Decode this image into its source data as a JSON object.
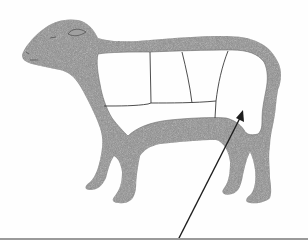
{
  "figure": {
    "colors": {
      "background": "#fefefe",
      "fleece": "#8f8f8f",
      "fleece_dark": "#7a7a7a",
      "cut_lines": "#3a3a3a",
      "arrow": "#1e1e1e",
      "bottom_rule": "#9a9a9a"
    },
    "cuts": [
      {
        "name": "shoulder"
      },
      {
        "name": "rack"
      },
      {
        "name": "loin"
      },
      {
        "name": "leg"
      },
      {
        "name": "breast"
      },
      {
        "name": "flank"
      }
    ],
    "arrow": {
      "target": "leg",
      "from": [
        178,
        240
      ],
      "to": [
        243,
        111
      ]
    }
  }
}
